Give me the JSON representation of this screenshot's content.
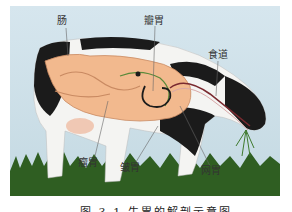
{
  "figure": {
    "labels": {
      "intestine": "肠",
      "omasum": "瓣胃",
      "esophagus": "食道",
      "rumen": "瘤胃",
      "abomasum": "皱胃",
      "reticulum": "网胃"
    },
    "caption": "图 3-1  牛胃的解剖示意图",
    "colors": {
      "sky": "#cfe0e8",
      "grass": "#2f5e22",
      "cow_black": "#1b1b1b",
      "cow_white": "#f4f4f2",
      "organ": "#f2b98e",
      "organ_line": "#5a8a3a"
    }
  }
}
